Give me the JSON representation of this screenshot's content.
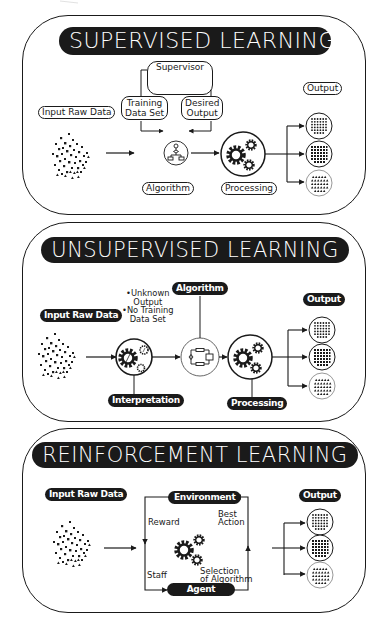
{
  "supervised": {
    "title": "SUPERVISED LEARNING",
    "input_label": "Input Raw Data",
    "supervisor_label": "Supervisor",
    "training_label_1": "Training",
    "training_label_2": "Data Set",
    "desired_label_1": "Desired",
    "desired_label_2": "Output",
    "algorithm_label": "Algorithm",
    "processing_label": "Processing",
    "output_label": "Output"
  },
  "unsupervised": {
    "title": "UNSUPERVISED LEARNING",
    "input_label": "Input Raw Data",
    "note_1": "•Unknown",
    "note_2": "Output",
    "note_3": "•No Training",
    "note_4": "Data Set",
    "algorithm_label": "Algorithm",
    "interpretation_label": "Interpretation",
    "processing_label": "Processing",
    "output_label": "Output"
  },
  "reinforcement": {
    "title": "REINFORCEMENT LEARNING",
    "input_label": "Input Raw Data",
    "environment_label": "Environment",
    "agent_label": "Agent",
    "reward_label": "Reward",
    "best_action_1": "Best",
    "best_action_2": "Action",
    "staff_label": "Staff",
    "selection_1": "Selection",
    "selection_2": "of Algorithm",
    "output_label": "Output"
  },
  "icons": {
    "data_cloud": "scatter-dots-icon",
    "supervisor": "person-at-computer-icon",
    "algorithm": "flowchart-icon",
    "processing": "gears-icon",
    "output_dots": "dot-grid-icon",
    "output_squares": "square-grid-icon",
    "output_triangles": "triangle-grid-icon"
  },
  "colors": {
    "ink": "#1a1a1a",
    "background": "#ffffff"
  }
}
